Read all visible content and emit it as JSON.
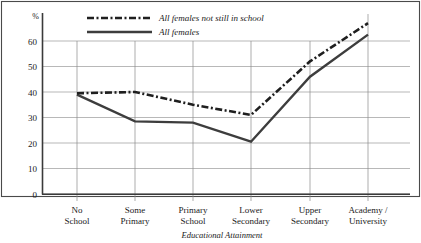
{
  "chart_data": {
    "type": "line",
    "title": "",
    "xlabel": "Educational Attainment",
    "ylabel": "%",
    "categories": [
      "No\nSchool",
      "Some\nPrimary",
      "Primary\nSchool",
      "Lower\nSecondary",
      "Upper\nSecondary",
      "Academy /\nUniversity"
    ],
    "category_lines": [
      [
        "No",
        "School"
      ],
      [
        "Some",
        "Primary"
      ],
      [
        "Primary",
        "School"
      ],
      [
        "Lower",
        "Secondary"
      ],
      [
        "Upper",
        "Secondary"
      ],
      [
        "Academy /",
        "University"
      ]
    ],
    "ylim": [
      0,
      70
    ],
    "yticks": [
      0,
      10,
      20,
      30,
      40,
      50,
      60
    ],
    "ytick_labels": [
      "0",
      "10",
      "20",
      "30",
      "40",
      "50",
      "60"
    ],
    "grid": true,
    "legend_position": "top-left-inside",
    "series": [
      {
        "name": "All females not still in school",
        "style": "dash-dot",
        "color": "#1f1f1f",
        "values": [
          39.5,
          40.0,
          35.0,
          31.0,
          52.0,
          67.0
        ]
      },
      {
        "name": "All females",
        "style": "solid",
        "color": "#3d3d3d",
        "values": [
          39.0,
          28.5,
          28.0,
          20.5,
          46.0,
          62.5
        ]
      }
    ]
  },
  "axis": {
    "y_unit_label": "%",
    "x_title": "Educational Attainment"
  },
  "legend": {
    "items": [
      {
        "label": "All females not still in school",
        "style": "dash-dot"
      },
      {
        "label": "All females",
        "style": "solid"
      }
    ]
  },
  "colors": {
    "grid": "#999999",
    "axis": "#3a3a3a",
    "frame": "#4a4a4a",
    "series_dashed": "#1f1f1f",
    "series_solid": "#3d3d3d",
    "background": "#ffffff"
  }
}
